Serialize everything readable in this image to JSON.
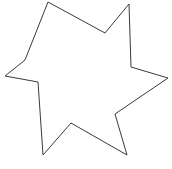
{
  "image": {
    "kind": "line-drawing",
    "subject": "six-pointed-star-outline",
    "description": "Hand-drawn outline of a six-pointed star",
    "width": 172,
    "height": 169,
    "background_color": "#ffffff",
    "stroke_color": "#3a3a3a",
    "fill_color": "#ffffff",
    "stroke_width": 1
  },
  "shape": {
    "name": "star",
    "point_count": 6,
    "closed": true,
    "vertices": [
      {
        "role": "outer-point-top-left",
        "x": 48,
        "y": 2
      },
      {
        "role": "inner-valley-top",
        "x": 105,
        "y": 33
      },
      {
        "role": "outer-point-top-right",
        "x": 129,
        "y": 4
      },
      {
        "role": "inner-valley-upper-right",
        "x": 131,
        "y": 67
      },
      {
        "role": "outer-point-right",
        "x": 168,
        "y": 78
      },
      {
        "role": "inner-valley-lower-right",
        "x": 115,
        "y": 114
      },
      {
        "role": "outer-point-bottom-right",
        "x": 127,
        "y": 155
      },
      {
        "role": "inner-valley-bottom",
        "x": 71,
        "y": 123
      },
      {
        "role": "outer-point-bottom-left",
        "x": 43,
        "y": 155
      },
      {
        "role": "inner-valley-lower-left",
        "x": 38,
        "y": 82
      },
      {
        "role": "outer-point-left",
        "x": 5,
        "y": 76
      },
      {
        "role": "inner-valley-upper-left",
        "x": 25,
        "y": 60
      }
    ]
  }
}
